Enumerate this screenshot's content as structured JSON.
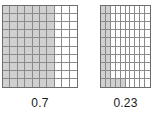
{
  "figure": {
    "type": "decimal-hundredths-grids",
    "columns": 10,
    "rows": 10,
    "grid_line_color": "#8a8a8a",
    "grid_border_color": "#6d6d6d",
    "shaded_color": "#d0d0d0",
    "unshaded_color": "#ffffff",
    "background": "#ffffff"
  },
  "grids": [
    {
      "id": "grid-left",
      "label": "0.7",
      "value": 0.7,
      "shaded_cells": 70,
      "total_cells": 100,
      "full_shaded_columns": 7,
      "partial_row_cells": 0
    },
    {
      "id": "grid-right",
      "label": "0.23",
      "value": 0.23,
      "shaded_cells": 23,
      "total_cells": 100,
      "full_shaded_columns": 2,
      "partial_row_cells": 3
    }
  ],
  "chart_data": {
    "type": "bar",
    "title": "",
    "subtitle": "",
    "xlabel": "",
    "ylabel": "",
    "categories": [
      "0.7",
      "0.23"
    ],
    "values": [
      0.7,
      0.23
    ],
    "value_labels": [
      "0.7",
      "0.23"
    ],
    "ylim": [
      0,
      1
    ],
    "grid": true,
    "legend": "none"
  }
}
